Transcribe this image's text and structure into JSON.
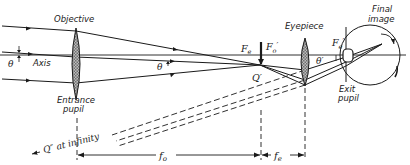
{
  "diagram": {
    "labels": {
      "objective": "Objective",
      "entrance_pupil_line1": "Entrance",
      "entrance_pupil_line2": "pupil",
      "axis": "Axis",
      "theta_left": "θ",
      "theta_mid": "θ",
      "focal_e": "F",
      "focal_e_sub": "e",
      "focal_o_prime": "F",
      "focal_o_prime_sub": "o",
      "focal_o_prime_mark": "′",
      "q_prime": "Q′",
      "eyepiece": "Eyepiece",
      "theta_prime": "θ′",
      "focal_e_prime": "F",
      "focal_e_prime_sub": "e",
      "focal_e_prime_mark": "′",
      "final_image_line1": "Final",
      "final_image_line2": "image",
      "exit_pupil_line1": "Exit",
      "exit_pupil_line2": "pupil",
      "q_double_prime": "Q″ at infinity",
      "fo": "f",
      "fo_sub": "o",
      "fe": "f",
      "fe_sub": "e"
    },
    "colors": {
      "line": "#1a1a1a",
      "lens_fill": "#8a8a8a",
      "background": "#ffffff"
    }
  }
}
